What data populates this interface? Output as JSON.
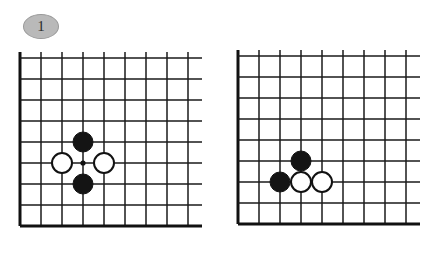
{
  "page": {
    "background_color": "#ffffff"
  },
  "figures": [
    {
      "badge_label": "1",
      "badge_name": "figure-badge-1",
      "caption": "",
      "board": {
        "columns": 8,
        "rows": 8,
        "cell_size": 21,
        "edges": [
          "left",
          "bottom"
        ],
        "marks": [
          {
            "col": 3,
            "row": 5,
            "type": "intersection-dot"
          }
        ],
        "stones": [
          {
            "col": 3,
            "row": 4,
            "color": "black"
          },
          {
            "col": 3,
            "row": 6,
            "color": "black"
          },
          {
            "col": 2,
            "row": 5,
            "color": "white"
          },
          {
            "col": 4,
            "row": 5,
            "color": "white"
          }
        ]
      }
    },
    {
      "badge_label": "2",
      "badge_name": "figure-badge-2",
      "caption": "",
      "board": {
        "columns": 8,
        "rows": 8,
        "cell_size": 21,
        "edges": [
          "left",
          "bottom"
        ],
        "marks": [],
        "stones": [
          {
            "col": 3,
            "row": 5,
            "color": "black"
          },
          {
            "col": 2,
            "row": 6,
            "color": "black"
          },
          {
            "col": 3,
            "row": 6,
            "color": "white"
          },
          {
            "col": 4,
            "row": 6,
            "color": "white"
          }
        ]
      }
    }
  ],
  "colors": {
    "line": "#1a1a1a",
    "edge_line": "#111111",
    "stone_black": "#141414",
    "stone_white": "#ffffff",
    "badge_fill": "#b9b9b9",
    "badge_border": "#9a9a9a",
    "background": "#ffffff"
  },
  "geometry": {
    "stone_radius": 10,
    "mark_radius": 2.6,
    "overhang": 14
  }
}
